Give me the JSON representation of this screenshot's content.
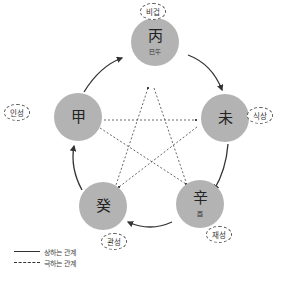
{
  "nodes": {
    "top": {
      "char": "丙",
      "sub": "巳午",
      "label": "비겁"
    },
    "right": {
      "char": "未",
      "sub": "",
      "label": "식상"
    },
    "bottom_right": {
      "char": "辛",
      "sub": "酉",
      "label": "재성"
    },
    "bottom_left": {
      "char": "癸",
      "sub": "",
      "label": "관성"
    },
    "left": {
      "char": "甲",
      "sub": "",
      "label": "인성"
    }
  },
  "legend": {
    "solid": "상하는 관계",
    "dashed": "극하는 관계"
  },
  "colors": {
    "node_fill": "#b3b3b3",
    "line": "#333333"
  }
}
